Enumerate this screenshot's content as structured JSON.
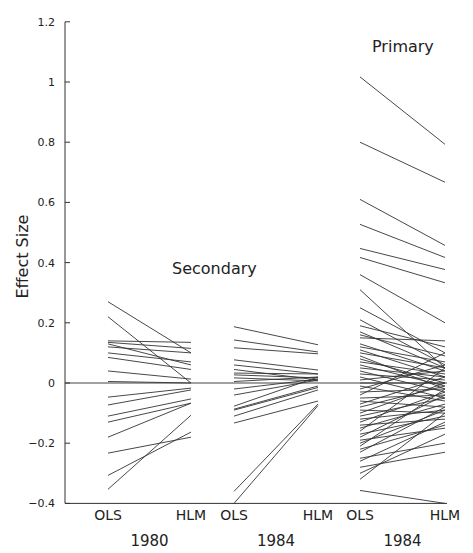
{
  "chart_data": {
    "type": "line",
    "title": "",
    "ylabel": "Effect Size",
    "xlabel": "",
    "ylim": [
      -0.4,
      1.2
    ],
    "yticks": [
      1.2,
      1,
      0.8,
      0.6,
      0.4,
      0.2,
      0,
      -0.2,
      -0.4
    ],
    "ytick_labels": [
      "1.2",
      "1",
      "0.8",
      "0.6",
      "0.4",
      "0.2",
      "0",
      "-0.2",
      "-0.4"
    ],
    "grid": false,
    "group_labels": [
      {
        "text": "Secondary",
        "near": "panels 1980 and 1984 (secondary)"
      },
      {
        "text": "Primary",
        "near": "panel 1984 (primary)"
      }
    ],
    "panels": [
      {
        "year": "1980",
        "group": "Secondary",
        "x_labels": [
          "OLS",
          "HLM"
        ],
        "series": [
          {
            "ols": 0.27,
            "hlm": 0.1
          },
          {
            "ols": 0.22,
            "hlm": 0.0
          },
          {
            "ols": 0.14,
            "hlm": 0.135
          },
          {
            "ols": 0.135,
            "hlm": 0.115
          },
          {
            "ols": 0.13,
            "hlm": 0.06
          },
          {
            "ols": 0.12,
            "hlm": 0.1
          },
          {
            "ols": 0.1,
            "hlm": 0.07
          },
          {
            "ols": 0.085,
            "hlm": 0.045
          },
          {
            "ols": 0.04,
            "hlm": 0.013
          },
          {
            "ols": 0.005,
            "hlm": 0.0
          },
          {
            "ols": -0.047,
            "hlm": -0.017
          },
          {
            "ols": -0.073,
            "hlm": -0.023
          },
          {
            "ols": -0.11,
            "hlm": -0.053
          },
          {
            "ols": -0.13,
            "hlm": -0.067
          },
          {
            "ols": -0.18,
            "hlm": -0.067
          },
          {
            "ols": -0.233,
            "hlm": -0.18
          },
          {
            "ols": -0.307,
            "hlm": -0.163
          },
          {
            "ols": -0.353,
            "hlm": -0.107
          }
        ]
      },
      {
        "year": "1984",
        "group": "Secondary",
        "x_labels": [
          "OLS",
          "HLM"
        ],
        "series": [
          {
            "ols": 0.187,
            "hlm": 0.127
          },
          {
            "ols": 0.143,
            "hlm": 0.103
          },
          {
            "ols": 0.117,
            "hlm": 0.097
          },
          {
            "ols": 0.077,
            "hlm": 0.043
          },
          {
            "ols": 0.06,
            "hlm": 0.03
          },
          {
            "ols": 0.045,
            "hlm": 0.01
          },
          {
            "ols": 0.033,
            "hlm": 0.03
          },
          {
            "ols": 0.027,
            "hlm": 0.017
          },
          {
            "ols": 0.017,
            "hlm": 0.007
          },
          {
            "ols": 0.005,
            "hlm": 0.02
          },
          {
            "ols": -0.02,
            "hlm": 0.013
          },
          {
            "ols": -0.04,
            "hlm": 0.01
          },
          {
            "ols": -0.077,
            "hlm": 0.02
          },
          {
            "ols": -0.087,
            "hlm": -0.01
          },
          {
            "ols": -0.09,
            "hlm": -0.015
          },
          {
            "ols": -0.11,
            "hlm": -0.023
          },
          {
            "ols": -0.133,
            "hlm": -0.06
          },
          {
            "ols": -0.36,
            "hlm": -0.07
          },
          {
            "ols": -0.4,
            "hlm": -0.075
          }
        ]
      },
      {
        "year": "1984",
        "group": "Primary",
        "x_labels": [
          "OLS",
          "HLM"
        ],
        "series": [
          {
            "ols": 1.017,
            "hlm": 0.793
          },
          {
            "ols": 0.8,
            "hlm": 0.667
          },
          {
            "ols": 0.61,
            "hlm": 0.457
          },
          {
            "ols": 0.527,
            "hlm": 0.417
          },
          {
            "ols": 0.447,
            "hlm": 0.377
          },
          {
            "ols": 0.417,
            "hlm": 0.333
          },
          {
            "ols": 0.36,
            "hlm": 0.2
          },
          {
            "ols": 0.31,
            "hlm": 0.05
          },
          {
            "ols": 0.25,
            "hlm": 0.1
          },
          {
            "ols": 0.21,
            "hlm": 0.06
          },
          {
            "ols": 0.19,
            "hlm": 0.12
          },
          {
            "ols": 0.17,
            "hlm": 0.05
          },
          {
            "ols": 0.16,
            "hlm": 0.09
          },
          {
            "ols": 0.15,
            "hlm": 0.14
          },
          {
            "ols": 0.13,
            "hlm": 0.04
          },
          {
            "ols": 0.12,
            "hlm": 0.07
          },
          {
            "ols": 0.11,
            "hlm": 0.02
          },
          {
            "ols": 0.1,
            "hlm": 0.05
          },
          {
            "ols": 0.09,
            "hlm": -0.02
          },
          {
            "ols": 0.08,
            "hlm": 0.0
          },
          {
            "ols": 0.07,
            "hlm": 0.03
          },
          {
            "ols": 0.06,
            "hlm": -0.01
          },
          {
            "ols": 0.05,
            "hlm": 0.02
          },
          {
            "ols": 0.04,
            "hlm": -0.03
          },
          {
            "ols": 0.03,
            "hlm": 0.01
          },
          {
            "ols": 0.02,
            "hlm": -0.05
          },
          {
            "ols": 0.01,
            "hlm": 0.04
          },
          {
            "ols": 0.0,
            "hlm": 0.0
          },
          {
            "ols": -0.01,
            "hlm": -0.06
          },
          {
            "ols": -0.02,
            "hlm": 0.06
          },
          {
            "ols": -0.03,
            "hlm": -0.02
          },
          {
            "ols": -0.04,
            "hlm": 0.1
          },
          {
            "ols": -0.05,
            "hlm": -0.04
          },
          {
            "ols": -0.06,
            "hlm": -0.08
          },
          {
            "ols": -0.07,
            "hlm": 0.02
          },
          {
            "ols": -0.08,
            "hlm": -0.01
          },
          {
            "ols": -0.09,
            "hlm": -0.1
          },
          {
            "ols": -0.1,
            "hlm": 0.0
          },
          {
            "ols": -0.11,
            "hlm": -0.05
          },
          {
            "ols": -0.12,
            "hlm": -0.09
          },
          {
            "ols": -0.13,
            "hlm": -0.03
          },
          {
            "ols": -0.14,
            "hlm": -0.12
          },
          {
            "ols": -0.15,
            "hlm": -0.07
          },
          {
            "ols": -0.16,
            "hlm": 0.05
          },
          {
            "ols": -0.17,
            "hlm": -0.11
          },
          {
            "ols": -0.18,
            "hlm": -0.04
          },
          {
            "ols": -0.19,
            "hlm": -0.15
          },
          {
            "ols": -0.2,
            "hlm": -0.09
          },
          {
            "ols": -0.21,
            "hlm": -0.02
          },
          {
            "ols": -0.22,
            "hlm": -0.14
          },
          {
            "ols": -0.23,
            "hlm": -0.08
          },
          {
            "ols": -0.25,
            "hlm": -0.2
          },
          {
            "ols": -0.26,
            "hlm": -0.13
          },
          {
            "ols": -0.28,
            "hlm": -0.23
          },
          {
            "ols": -0.3,
            "hlm": -0.17
          },
          {
            "ols": -0.32,
            "hlm": -0.1
          },
          {
            "ols": -0.357,
            "hlm": -0.4
          }
        ]
      }
    ]
  }
}
